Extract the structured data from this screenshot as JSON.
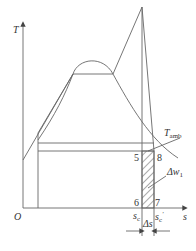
{
  "diagram": {
    "type": "T-s diagram",
    "axes": {
      "y_label": "T",
      "x_label": "s",
      "origin_label": "O"
    },
    "labels": {
      "t_amb": "T",
      "t_amb_sub": "amb",
      "point_5": "5",
      "point_6": "6",
      "point_7": "7",
      "point_8": "8",
      "delta_w": "Δw",
      "delta_w_sub": "1",
      "s_c": "s",
      "s_c_sub": "c",
      "s_c_prime": "s",
      "s_c_prime_sub": "c",
      "s_c_prime_mark": "′",
      "delta_s": "Δs"
    },
    "colors": {
      "line": "#555555",
      "text": "#333333",
      "hatch": "#555555"
    }
  }
}
